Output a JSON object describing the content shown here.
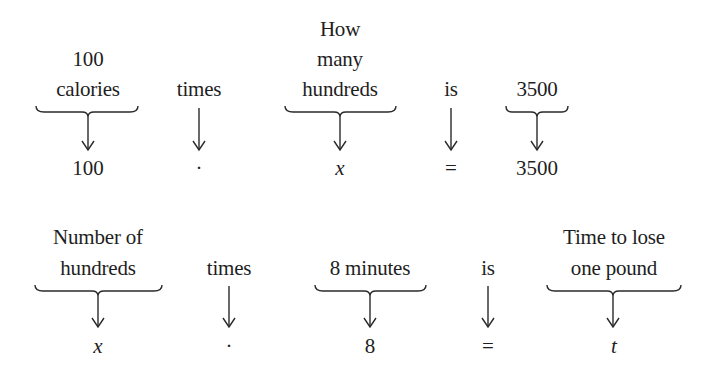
{
  "diagram": {
    "type": "word-to-equation translation",
    "rows": [
      {
        "id": "row1",
        "terms": [
          {
            "label_lines": [
              "100",
              "calories"
            ],
            "has_brace": true,
            "symbol": "100",
            "italic": false
          },
          {
            "label_lines": [
              "times"
            ],
            "has_brace": false,
            "symbol": "·",
            "italic": false
          },
          {
            "label_lines": [
              "How",
              "many",
              "hundreds"
            ],
            "has_brace": true,
            "symbol": "x",
            "italic": true
          },
          {
            "label_lines": [
              "is"
            ],
            "has_brace": false,
            "symbol": "=",
            "italic": false
          },
          {
            "label_lines": [
              "3500"
            ],
            "has_brace": true,
            "symbol": "3500",
            "italic": false
          }
        ],
        "equation": "100 · x = 3500"
      },
      {
        "id": "row2",
        "terms": [
          {
            "label_lines": [
              "Number of",
              "hundreds"
            ],
            "has_brace": true,
            "symbol": "x",
            "italic": true
          },
          {
            "label_lines": [
              "times"
            ],
            "has_brace": false,
            "symbol": "·",
            "italic": false
          },
          {
            "label_lines": [
              "8 minutes"
            ],
            "has_brace": true,
            "symbol": "8",
            "italic": false
          },
          {
            "label_lines": [
              "is"
            ],
            "has_brace": false,
            "symbol": "=",
            "italic": false
          },
          {
            "label_lines": [
              "Time to lose",
              "one pound"
            ],
            "has_brace": true,
            "symbol": "t",
            "italic": true
          }
        ],
        "equation": "x · 8 = t"
      }
    ]
  }
}
